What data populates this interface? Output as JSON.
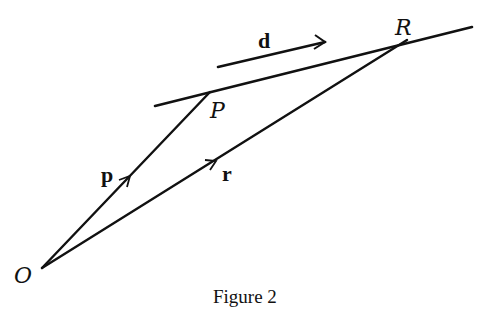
{
  "figure": {
    "caption": "Figure 2",
    "points": {
      "O": {
        "label": "O",
        "x": 42,
        "y": 268
      },
      "P": {
        "label": "P",
        "x": 210,
        "y": 92
      },
      "R": {
        "label": "R",
        "x": 407,
        "y": 40
      }
    },
    "line": {
      "x1": 155,
      "y1": 106,
      "x2": 472,
      "y2": 27
    },
    "vectors": {
      "p": {
        "label": "p",
        "from": "O",
        "to": "P"
      },
      "r": {
        "label": "r",
        "from": "O",
        "to": "R"
      },
      "d": {
        "label": "d",
        "x1": 218,
        "y1": 67,
        "x2": 325,
        "y2": 42
      }
    },
    "colors": {
      "ink": "#111111",
      "background": "#ffffff"
    }
  }
}
